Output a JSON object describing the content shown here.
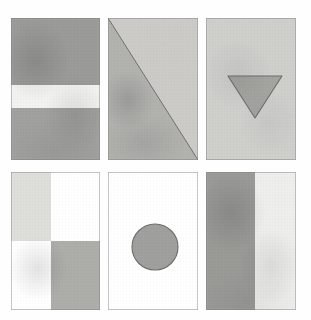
{
  "artwork": {
    "title": "Watercolor Geometric Panels",
    "background_color": "#fefefe",
    "canvas": {
      "width": 311,
      "height": 320
    },
    "grid": {
      "rows": 2,
      "columns": 3
    },
    "medium": "watercolor"
  },
  "palette": {
    "paper_white": "#ffffff",
    "near_white": "#f4f4f3",
    "very_light_gray": "#e6e6e4",
    "light_gray": "#cfcfcc",
    "mid_light_gray": "#c2c2bf",
    "mid_gray": "#a8a8a5",
    "gray": "#9b9b99",
    "dark_gray": "#8e8e8c",
    "outline": "#6e6e6e"
  },
  "panels": [
    {
      "id": "panel-1",
      "name": "horizontal-band-panel",
      "position": "top-left",
      "description": "Dark gray rectangle crossed by a light horizontal band",
      "rect": {
        "x": 11,
        "y": 18,
        "width": 89,
        "height": 142
      },
      "shapes": [
        {
          "kind": "rectangle",
          "name": "upper-gray-block",
          "fill": "#9b9b99",
          "x": 0,
          "y": 0,
          "width": 89,
          "height": 67
        },
        {
          "kind": "rectangle",
          "name": "light-band",
          "fill": "#f2f2f0",
          "x": 0,
          "y": 67,
          "width": 89,
          "height": 23
        },
        {
          "kind": "rectangle",
          "name": "lower-gray-block",
          "fill": "#a1a1a0",
          "x": 0,
          "y": 90,
          "width": 89,
          "height": 52
        }
      ]
    },
    {
      "id": "panel-2",
      "name": "diagonal-split-panel",
      "position": "top-middle",
      "description": "Square split corner to corner by a diagonal; lower-left half is darker",
      "rect": {
        "x": 108,
        "y": 18,
        "width": 90,
        "height": 142
      },
      "shapes": [
        {
          "kind": "triangle",
          "name": "upper-right-half",
          "fill": "#cccbc8",
          "points": "0,0 90,0 90,142"
        },
        {
          "kind": "triangle",
          "name": "lower-left-half",
          "fill": "#b2b2af",
          "points": "0,0 90,142 0,142"
        },
        {
          "kind": "line",
          "name": "diagonal-line",
          "stroke": "#6e6e6e",
          "x1": 0,
          "y1": 0,
          "x2": 90,
          "y2": 142
        }
      ]
    },
    {
      "id": "panel-3",
      "name": "inverted-triangle-panel",
      "position": "top-right",
      "description": "Light gray field with a downward-pointing gray triangle",
      "rect": {
        "x": 206,
        "y": 18,
        "width": 90,
        "height": 142
      },
      "shapes": [
        {
          "kind": "rectangle",
          "name": "light-field",
          "fill": "#cfcfcc",
          "x": 0,
          "y": 0,
          "width": 90,
          "height": 142
        },
        {
          "kind": "triangle",
          "name": "inverted-triangle",
          "fill": "#a4a4a1",
          "stroke": "#6e6e6e",
          "points": "22,58 76,58 49,100"
        }
      ]
    },
    {
      "id": "panel-4",
      "name": "checkerboard-panel",
      "position": "bottom-left",
      "description": "Two-by-two checkerboard: light gray top-left, white top-right, white bottom-left, mid gray bottom-right",
      "rect": {
        "x": 11,
        "y": 172,
        "width": 89,
        "height": 138
      },
      "shapes": [
        {
          "kind": "rectangle",
          "name": "quadrant-top-left",
          "fill": "#dededb",
          "x": 0,
          "y": 0,
          "width": 40,
          "height": 69
        },
        {
          "kind": "rectangle",
          "name": "quadrant-top-right",
          "fill": "#ffffff",
          "x": 40,
          "y": 0,
          "width": 49,
          "height": 69
        },
        {
          "kind": "rectangle",
          "name": "quadrant-bottom-left",
          "fill": "#ffffff",
          "x": 0,
          "y": 69,
          "width": 40,
          "height": 69
        },
        {
          "kind": "rectangle",
          "name": "quadrant-bottom-right",
          "fill": "#adadaa",
          "x": 40,
          "y": 69,
          "width": 49,
          "height": 69
        }
      ]
    },
    {
      "id": "panel-5",
      "name": "circle-panel",
      "position": "bottom-middle",
      "description": "White field with a single gray circle below centre",
      "rect": {
        "x": 108,
        "y": 172,
        "width": 90,
        "height": 138
      },
      "shapes": [
        {
          "kind": "rectangle",
          "name": "white-field",
          "fill": "#ffffff",
          "x": 0,
          "y": 0,
          "width": 90,
          "height": 138
        },
        {
          "kind": "circle",
          "name": "gray-circle",
          "fill": "#a0a09e",
          "stroke": "#6e6e6e",
          "cx": 47,
          "cy": 75,
          "r": 23
        }
      ]
    },
    {
      "id": "panel-6",
      "name": "vertical-bands-panel",
      "position": "bottom-right",
      "description": "Two vertical bands: darker gray at left, near-white at right",
      "rect": {
        "x": 206,
        "y": 172,
        "width": 90,
        "height": 138
      },
      "shapes": [
        {
          "kind": "rectangle",
          "name": "left-dark-band",
          "fill": "#9a9a97",
          "x": 0,
          "y": 0,
          "width": 49,
          "height": 138
        },
        {
          "kind": "rectangle",
          "name": "right-light-band",
          "fill": "#eeeeec",
          "x": 49,
          "y": 0,
          "width": 41,
          "height": 138
        }
      ]
    }
  ]
}
